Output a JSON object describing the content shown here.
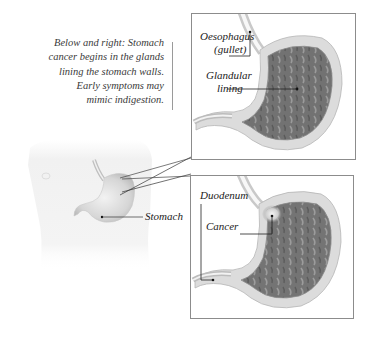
{
  "caption": {
    "lines": [
      "Below and right: Stomach",
      "cancer begins in the glands",
      "lining the stomach walls.",
      "Early symptoms may",
      "mimic indigestion."
    ]
  },
  "torso": {
    "labels": {
      "stomach": "Stomach"
    }
  },
  "panel_top": {
    "labels": {
      "oesophagus_line1": "Oesophagus",
      "oesophagus_line2": "(gullet)",
      "glandular_line1": "Glandular",
      "glandular_line2": "lining"
    }
  },
  "panel_bottom": {
    "labels": {
      "duodenum": "Duodenum",
      "cancer": "Cancer"
    }
  },
  "colors": {
    "panel_border": "#8c8c8c",
    "stomach_wall": "#d9d9d9",
    "stomach_lining": "#6f6f6f",
    "text": "#222222"
  }
}
